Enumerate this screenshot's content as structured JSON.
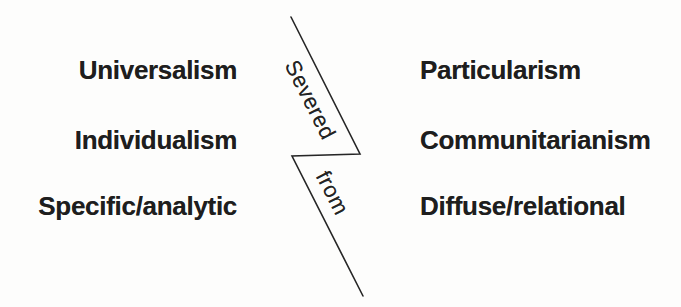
{
  "diagram": {
    "rows": [
      {
        "left": "Universalism",
        "right": "Particularism"
      },
      {
        "left": "Individualism",
        "right": "Communitarianism"
      },
      {
        "left": "Specific/analytic",
        "right": "Diffuse/relational"
      }
    ],
    "divider": {
      "upper_label": "Severed",
      "lower_label": "from"
    },
    "colors": {
      "background": "#fdfdfc",
      "text": "#1e1e1e",
      "line": "#262626"
    }
  }
}
